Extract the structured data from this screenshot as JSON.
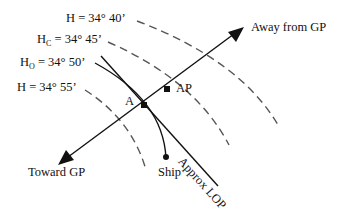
{
  "diagram": {
    "labels": {
      "h_4040": {
        "prefix": "H",
        "sub": "",
        "value": " = 34° 40’"
      },
      "hc": {
        "prefix": "H",
        "sub": "C",
        "value": " =  34° 45’"
      },
      "ho": {
        "prefix": "H",
        "sub": "O",
        "value": " =  34° 50’"
      },
      "h_4055": {
        "prefix": "H",
        "sub": "",
        "value": " = 34° 55’"
      },
      "away": "Away from GP",
      "toward": "Toward GP",
      "a": "A",
      "ap": "AP",
      "ship": "Ship",
      "lop": "Approx LOP"
    },
    "colors": {
      "line": "#111111",
      "dash": "#555555"
    }
  }
}
